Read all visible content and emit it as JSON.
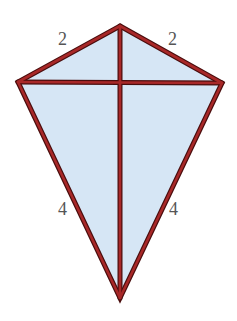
{
  "diagram": {
    "type": "kite",
    "colors": {
      "fill": "#d6e6f5",
      "stroke": "#8b1a1a",
      "stroke_outline": "#4a0d0d",
      "label": "#555555"
    },
    "vertices": {
      "top": [
        120,
        26
      ],
      "left": [
        18,
        82
      ],
      "right": [
        222,
        83
      ],
      "bottom": [
        120,
        298
      ],
      "diagonal_intersection": [
        120,
        83
      ]
    },
    "edges": [
      {
        "name": "top-left",
        "from": "top",
        "to": "left",
        "label": "2"
      },
      {
        "name": "top-right",
        "from": "top",
        "to": "right",
        "label": "2"
      },
      {
        "name": "bottom-left",
        "from": "left",
        "to": "bottom",
        "label": "4"
      },
      {
        "name": "bottom-right",
        "from": "right",
        "to": "bottom",
        "label": "4"
      }
    ],
    "diagonals": [
      {
        "name": "vertical",
        "from": "top",
        "to": "bottom"
      },
      {
        "name": "horizontal",
        "from": "left",
        "to": "right"
      }
    ],
    "labels": {
      "top_left": "2",
      "top_right": "2",
      "bottom_left": "4",
      "bottom_right": "4"
    }
  }
}
